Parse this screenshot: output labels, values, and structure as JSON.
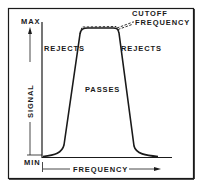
{
  "diagram": {
    "type": "bandpass-filter-response",
    "y_axis": {
      "label": "SIGNAL",
      "max_label": "MAX",
      "min_label": "MIN"
    },
    "x_axis": {
      "label": "FREQUENCY"
    },
    "regions": {
      "left": "REJECTS",
      "center": "PASSES",
      "right": "REJECTS"
    },
    "annotation": {
      "line1": "CUTOFF",
      "line2": "FREQUENCY"
    },
    "colors": {
      "ink": "#1a1a1a",
      "background": "#ffffff"
    }
  }
}
